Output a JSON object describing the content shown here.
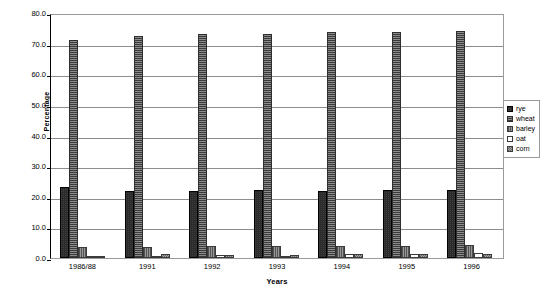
{
  "chart_data": {
    "type": "bar",
    "title": "",
    "subtitle": "",
    "xlabel": "Years",
    "ylabel": "Percentage",
    "ylim": [
      0.0,
      80.0
    ],
    "ytick_step": 10.0,
    "ytick_labels": [
      "80.0",
      "70.0",
      "60.0",
      "50.0",
      "40.0",
      "30.0",
      "20.0",
      "10.0",
      "0.0"
    ],
    "ytick_values": [
      80.0,
      70.0,
      60.0,
      50.0,
      40.0,
      30.0,
      20.0,
      10.0,
      0.0
    ],
    "grid": true,
    "grid_axis": "y",
    "legend_position": "right",
    "categories": [
      "1986/88",
      "1991",
      "1992",
      "1993",
      "1994",
      "1995",
      "1996"
    ],
    "series": [
      {
        "name": "rye",
        "color": "#2b2b2b",
        "values": [
          23.3,
          21.8,
          21.8,
          22.1,
          21.9,
          22.1,
          22.1
        ]
      },
      {
        "name": "wheat",
        "color": "#5a5a5a",
        "values": [
          71.1,
          72.5,
          73.3,
          73.3,
          73.7,
          73.8,
          74.2
        ]
      },
      {
        "name": "barley",
        "color": "#767676",
        "values": [
          3.7,
          3.6,
          3.8,
          3.8,
          4.0,
          4.0,
          4.1
        ]
      },
      {
        "name": "oat",
        "color": "#ffffff",
        "values": [
          0.8,
          0.7,
          0.9,
          0.8,
          1.2,
          1.3,
          1.5
        ]
      },
      {
        "name": "corn",
        "color": "#8d8d8d",
        "values": [
          0.3,
          1.4,
          1.1,
          1.1,
          1.2,
          1.3,
          1.4
        ]
      }
    ]
  }
}
